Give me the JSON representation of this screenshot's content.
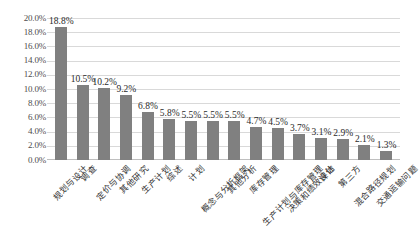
{
  "chart_data": {
    "type": "bar",
    "title": "",
    "subtitle": "",
    "xlabel": "",
    "ylabel": "",
    "ylim": [
      0,
      20
    ],
    "ytick_labels": [
      "20.0%",
      "18.0%",
      "16.0%",
      "14.0%",
      "12.0%",
      "10.0%",
      "8.0%",
      "6.0%",
      "4.0%",
      "2.0%",
      "0.0%"
    ],
    "ytick_values": [
      20,
      18,
      16,
      14,
      12,
      10,
      8,
      6,
      4,
      2,
      0
    ],
    "grid": "horizontal",
    "legend": "none",
    "orientation": "vertical",
    "bar_color": "#808080",
    "gridline_color": "#d9d9d9",
    "categories": [
      "规划与设计",
      "调查",
      "定价与协调",
      "其他研究",
      "生产计划",
      "综述",
      "计划",
      "概念与分析框架",
      "其他分析",
      "库存管理",
      "生产计划与库存管理",
      "决策和绩效评估",
      "设计",
      "第三方",
      "混合路径规划",
      "交通运输问题"
    ],
    "values": [
      18.8,
      10.5,
      10.2,
      9.2,
      6.8,
      5.8,
      5.5,
      5.5,
      5.5,
      4.7,
      4.5,
      3.7,
      3.1,
      2.9,
      2.1,
      1.3
    ],
    "data_labels": [
      "18.8%",
      "10.5%",
      "10.2%",
      "9.2%",
      "6.8%",
      "5.8%",
      "5.5%",
      "5.5%",
      "5.5%",
      "4.7%",
      "4.5%",
      "3.7%",
      "3.1%",
      "2.9%",
      "2.1%",
      "1.3%"
    ]
  }
}
